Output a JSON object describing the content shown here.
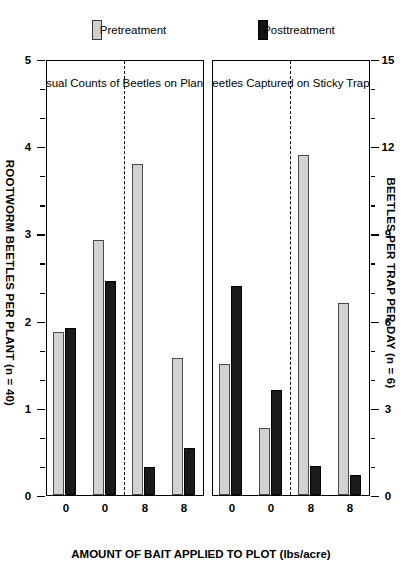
{
  "figure": {
    "top_axis_title": "BEETLES PER TRAP PER DAY (n = 6)",
    "bottom_axis_title": "ROOTWORM BEETLES PER PLANT (n = 40)",
    "category_axis_title": "AMOUNT OF BAIT APPLIED TO PLOT (lbs/acre)"
  },
  "legends": {
    "posttreatment": "Posttreatment",
    "pretreatment": "Pretreatment",
    "post_color": "#131313",
    "pre_color": "#cfcfcf"
  },
  "panels": [
    {
      "caption": "Beetles Captured on Sticky Traps",
      "axis_title": "BEETLES PER TRAP PER DAY (n = 6)",
      "tick_labels": [
        "15",
        "12",
        "9",
        "6",
        "3",
        "0"
      ],
      "category_labels": [
        "8",
        "8",
        "0",
        "0"
      ]
    },
    {
      "caption": "Visual Counts of Beetles on Plants",
      "axis_title": "ROOTWORM BEETLES PER PLANT (n = 40)",
      "tick_labels": [
        "5",
        "4",
        "3",
        "2",
        "1",
        "0"
      ],
      "category_labels": [
        "8",
        "8",
        "0",
        "0"
      ]
    }
  ],
  "chart_data": [
    {
      "type": "bar",
      "title": "Beetles Captured on Sticky Traps",
      "orientation": "horizontal",
      "xlabel": "BEETLES PER TRAP PER DAY (n = 6)",
      "ylabel": "AMOUNT OF BAIT APPLIED TO PLOT (lbs/acre)",
      "xlim": [
        0,
        15
      ],
      "xticks": [
        0,
        3,
        6,
        9,
        12,
        15
      ],
      "grid": false,
      "legend_position": "left-outside",
      "categories": [
        "8",
        "8",
        "0",
        "0"
      ],
      "series": [
        {
          "name": "Pretreatment",
          "color": "#cfcfcf",
          "values": [
            6.6,
            11.7,
            2.3,
            4.5
          ]
        },
        {
          "name": "Posttreatment",
          "color": "#131313",
          "values": [
            0.7,
            1.0,
            3.6,
            7.2
          ]
        }
      ]
    },
    {
      "type": "bar",
      "title": "Visual Counts of Beetles on Plants",
      "orientation": "horizontal",
      "xlabel": "ROOTWORM BEETLES PER PLANT (n = 40)",
      "ylabel": "AMOUNT OF BAIT APPLIED TO PLOT (lbs/acre)",
      "xlim": [
        0,
        5
      ],
      "xticks": [
        0,
        1,
        2,
        3,
        4,
        5
      ],
      "grid": false,
      "legend_position": "left-outside",
      "categories": [
        "8",
        "8",
        "0",
        "0"
      ],
      "series": [
        {
          "name": "Pretreatment",
          "color": "#cfcfcf",
          "values": [
            1.57,
            3.8,
            2.92,
            1.87
          ]
        },
        {
          "name": "Posttreatment",
          "color": "#131313",
          "values": [
            0.54,
            0.32,
            2.46,
            1.92
          ]
        }
      ]
    }
  ]
}
